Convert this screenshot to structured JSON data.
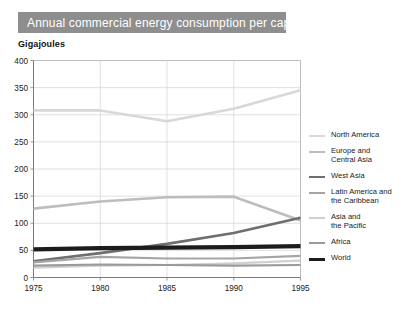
{
  "title": "Annual commercial energy consumption per capita",
  "unit_label": "Gigajoules",
  "chart_data": {
    "type": "line",
    "title": "Annual commercial energy consumption per capita",
    "subtitle": "",
    "xlabel": "",
    "ylabel": "Gigajoules",
    "x": [
      1975,
      1980,
      1985,
      1990,
      1995
    ],
    "xtick_labels": [
      "1975",
      "1980",
      "1985",
      "1990",
      "1995"
    ],
    "ytick_labels": [
      "0",
      "50",
      "100",
      "150",
      "200",
      "250",
      "300",
      "350",
      "400"
    ],
    "yticks": [
      0,
      50,
      100,
      150,
      200,
      250,
      300,
      350,
      400
    ],
    "ylim": [
      0,
      400
    ],
    "xlim": [
      1975,
      1995
    ],
    "grid": true,
    "legend_position": "right",
    "series": [
      {
        "name": "North America",
        "values": [
          308,
          308,
          288,
          311,
          345
        ],
        "color": "#d8d8d8",
        "width": 2.6
      },
      {
        "name": "Europe and\nCentral Asia",
        "values": [
          127,
          140,
          148,
          149,
          105
        ],
        "color": "#bdbdbd",
        "width": 2.6
      },
      {
        "name": "West Asia",
        "values": [
          30,
          45,
          62,
          82,
          110
        ],
        "color": "#6e6e6e",
        "width": 2.6
      },
      {
        "name": "Latin America and\nthe Caribbean",
        "values": [
          28,
          38,
          35,
          35,
          40
        ],
        "color": "#a5a5a5",
        "width": 2.2
      },
      {
        "name": "Asia and\nthe Pacific",
        "values": [
          18,
          22,
          23,
          26,
          31
        ],
        "color": "#d0d0d0",
        "width": 2.2
      },
      {
        "name": "Africa",
        "values": [
          22,
          24,
          23,
          22,
          23
        ],
        "color": "#9a9a9a",
        "width": 2.2
      },
      {
        "name": "World",
        "values": [
          52,
          54,
          55,
          56,
          58
        ],
        "color": "#1c1c1c",
        "width": 4.2
      }
    ]
  },
  "colors": {
    "title_banner": "#8e8e8e",
    "title_text": "#ffffff",
    "grid": "#d2d2d2",
    "frame": "#b9b9b9",
    "axis": "#7a7a7a",
    "background": "#ffffff"
  }
}
